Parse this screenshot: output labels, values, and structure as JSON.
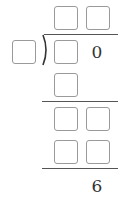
{
  "problem": {
    "type": "long-division",
    "quotient": {
      "digits": [
        "",
        ""
      ]
    },
    "divisor": {
      "digits": [
        ""
      ]
    },
    "dividend": {
      "digits": [
        "",
        "0"
      ]
    },
    "steps": [
      {
        "row": "subtract-1",
        "digits": [
          ""
        ]
      },
      {
        "row": "remainder-bring-down",
        "digits": [
          "",
          ""
        ]
      },
      {
        "row": "subtract-2",
        "digits": [
          "",
          ""
        ]
      }
    ],
    "remainder": {
      "digits": [
        "6"
      ]
    }
  },
  "labels": {
    "dividend_known_digit": "0",
    "remainder_value": "6"
  },
  "colors": {
    "box_border": "#9a9a9a",
    "line": "#555555",
    "text": "#333333"
  }
}
